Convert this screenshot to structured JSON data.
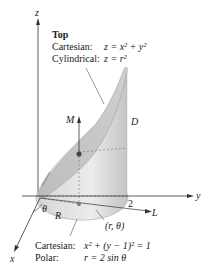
{
  "figure": {
    "axes": {
      "z": "z",
      "y": "y",
      "x": "x"
    },
    "top_caption": {
      "title": "Top",
      "cartesian_label": "Cartesian:",
      "cartesian_eq": "z = x² + y²",
      "cylindrical_label": "Cylindrical:",
      "cylindrical_eq": "z = r²"
    },
    "labels": {
      "M": "M",
      "D": "D",
      "two": "2",
      "L": "L",
      "R": "R",
      "theta": "θ",
      "point": "(r, θ)"
    },
    "bottom_caption": {
      "cartesian_label": "Cartesian:",
      "cartesian_eq": "x² + (y − 1)² = 1",
      "polar_label": "Polar:",
      "polar_eq": "r = 2 sin θ"
    },
    "colors": {
      "surface_light": "#e2e2e2",
      "surface_mid": "#cfcfcf",
      "surface_dark": "#b9b9b9",
      "line": "#333333"
    }
  }
}
